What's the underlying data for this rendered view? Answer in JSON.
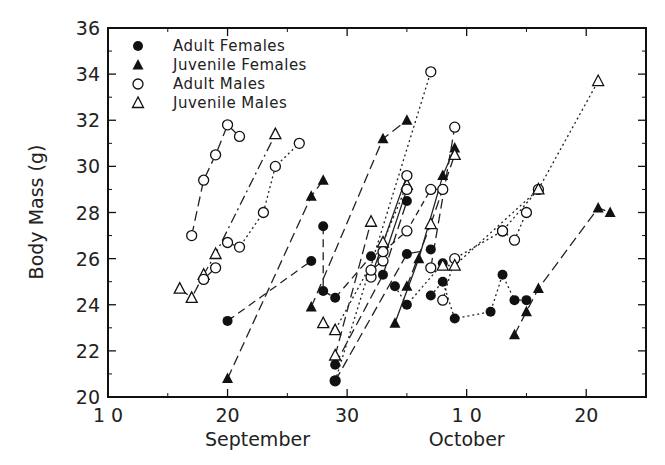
{
  "chart_data": {
    "type": "scatter",
    "title": "",
    "xlabel": "",
    "ylabel": "Body Mass (g)",
    "x_unit": "day (Sep 10 = 10; Oct 1 = 31)",
    "xlim": [
      10,
      55
    ],
    "ylim": [
      20,
      36
    ],
    "x_ticks": [
      {
        "value": 10,
        "label": "1 0"
      },
      {
        "value": 20,
        "label": "20"
      },
      {
        "value": 30,
        "label": "30"
      },
      {
        "value": 40,
        "label": "1 0"
      },
      {
        "value": 50,
        "label": "20"
      }
    ],
    "x_minor_ticks": [
      15,
      25,
      35,
      45
    ],
    "month_labels": [
      {
        "label": "September",
        "center": 22.5
      },
      {
        "label": "October",
        "center": 40
      }
    ],
    "y_ticks": [
      20,
      22,
      24,
      26,
      28,
      30,
      32,
      34,
      36
    ],
    "y_minor_ticks": [
      21,
      23,
      25,
      27,
      29,
      31,
      33,
      35
    ],
    "grid": false,
    "legend_position": "upper-left",
    "legend": [
      {
        "label": "Adult Females",
        "marker": "filled-circle"
      },
      {
        "label": "Juvenile Females",
        "marker": "filled-triangle"
      },
      {
        "label": "Adult Males",
        "marker": "open-circle"
      },
      {
        "label": "Juvenile Males",
        "marker": "open-triangle"
      }
    ],
    "series": [
      {
        "name": "Adult Males",
        "marker": "open-circle",
        "dash": "10,5",
        "points": [
          [
            17,
            27.0
          ],
          [
            18,
            29.4
          ],
          [
            19,
            30.5
          ],
          [
            20,
            31.8
          ],
          [
            21,
            31.3
          ]
        ]
      },
      {
        "name": "Adult Males",
        "marker": "open-circle",
        "dash": "2,3",
        "points": [
          [
            20,
            26.7
          ],
          [
            21,
            26.5
          ],
          [
            23,
            28.0
          ],
          [
            24,
            30.0
          ],
          [
            26,
            31.0
          ]
        ]
      },
      {
        "name": "Juvenile Males",
        "marker": "open-triangle",
        "dash": "10,4,2,4",
        "points": [
          [
            16,
            24.7
          ],
          [
            17,
            24.3
          ],
          [
            18,
            25.3
          ],
          [
            19,
            26.2
          ],
          [
            24,
            31.4
          ]
        ]
      },
      {
        "name": "Adult Males",
        "marker": "open-circle",
        "dash": "",
        "points": [
          [
            18,
            25.1
          ],
          [
            19,
            25.6
          ]
        ]
      },
      {
        "name": "Adult Females",
        "marker": "filled-circle",
        "dash": "8,5",
        "points": [
          [
            20,
            23.3
          ],
          [
            27,
            25.9
          ]
        ]
      },
      {
        "name": "Juvenile Females",
        "marker": "filled-triangle",
        "dash": "10,5",
        "points": [
          [
            20,
            20.8
          ],
          [
            27,
            28.7
          ],
          [
            28,
            29.4
          ]
        ]
      },
      {
        "name": "Adult Females",
        "marker": "filled-circle",
        "dash": "8,5",
        "points": [
          [
            28,
            27.4
          ],
          [
            28,
            24.6
          ],
          [
            29,
            24.3
          ],
          [
            32,
            26.1
          ]
        ]
      },
      {
        "name": "Juvenile Females",
        "marker": "filled-triangle",
        "dash": "10,5",
        "points": [
          [
            27,
            23.9
          ],
          [
            33,
            31.2
          ],
          [
            35,
            32.0
          ]
        ]
      },
      {
        "name": "Juvenile Males",
        "marker": "open-triangle",
        "dash": "2,3",
        "points": [
          [
            28,
            23.2
          ],
          [
            29,
            22.9
          ],
          [
            33,
            26.7
          ],
          [
            35,
            29.2
          ]
        ]
      },
      {
        "name": "Juvenile Males",
        "marker": "open-triangle",
        "dash": "10,5",
        "points": [
          [
            29,
            21.8
          ],
          [
            32,
            27.6
          ]
        ]
      },
      {
        "name": "Adult Females",
        "marker": "filled-circle",
        "dash": "10,5",
        "points": [
          [
            29,
            21.4
          ],
          [
            33,
            25.3
          ],
          [
            35,
            28.5
          ]
        ]
      },
      {
        "name": "Adult Males",
        "marker": "open-circle",
        "dash": "2,3",
        "points": [
          [
            29,
            20.7
          ],
          [
            37,
            34.1
          ]
        ]
      },
      {
        "name": "Adult Females",
        "marker": "filled-circle",
        "dash": "10,5",
        "points": [
          [
            29,
            20.7
          ],
          [
            35,
            26.2
          ],
          [
            37,
            26.4
          ]
        ]
      },
      {
        "name": "Adult Males",
        "marker": "open-circle",
        "dash": "",
        "points": [
          [
            32,
            25.2
          ],
          [
            35,
            29.6
          ]
        ]
      },
      {
        "name": "Adult Males",
        "marker": "open-circle",
        "dash": "",
        "points": [
          [
            32,
            25.5
          ],
          [
            33,
            25.9
          ],
          [
            35,
            29.0
          ]
        ]
      },
      {
        "name": "Adult Males",
        "marker": "open-circle",
        "dash": "6,4",
        "points": [
          [
            33,
            26.3
          ],
          [
            35,
            27.2
          ],
          [
            37,
            29.0
          ],
          [
            38,
            29.0
          ]
        ]
      },
      {
        "name": "Adult Females",
        "marker": "filled-circle",
        "dash": "2,3",
        "points": [
          [
            34,
            24.8
          ],
          [
            35,
            24.0
          ],
          [
            38,
            25.8
          ]
        ]
      },
      {
        "name": "Juvenile Females",
        "marker": "filled-triangle",
        "dash": "",
        "points": [
          [
            34,
            23.2
          ],
          [
            36,
            26.0
          ],
          [
            38,
            29.6
          ],
          [
            39,
            30.8
          ]
        ]
      },
      {
        "name": "Juvenile Females",
        "marker": "filled-triangle",
        "dash": "10,5",
        "points": [
          [
            35,
            24.8
          ],
          [
            37,
            27.5
          ]
        ]
      },
      {
        "name": "Juvenile Males",
        "marker": "open-triangle",
        "dash": "10,5",
        "points": [
          [
            37,
            27.5
          ],
          [
            39,
            30.5
          ]
        ]
      },
      {
        "name": "Adult Males",
        "marker": "open-circle",
        "dash": "10,5",
        "points": [
          [
            37,
            25.6
          ],
          [
            39,
            31.7
          ]
        ]
      },
      {
        "name": "Adult Females",
        "marker": "filled-circle",
        "dash": "2,3",
        "points": [
          [
            37,
            24.4
          ],
          [
            38,
            25.0
          ],
          [
            39,
            23.4
          ],
          [
            42,
            23.7
          ],
          [
            43,
            25.3
          ],
          [
            44,
            24.2
          ],
          [
            45,
            24.2
          ]
        ]
      },
      {
        "name": "Adult Males",
        "marker": "open-circle",
        "dash": "2,3",
        "points": [
          [
            38,
            24.2
          ],
          [
            39,
            26.0
          ],
          [
            43,
            27.2
          ],
          [
            46,
            29.0
          ]
        ]
      },
      {
        "name": "Juvenile Males",
        "marker": "open-triangle",
        "dash": "2,3",
        "points": [
          [
            38,
            25.7
          ],
          [
            39,
            25.7
          ],
          [
            46,
            29.0
          ],
          [
            51,
            33.7
          ]
        ]
      },
      {
        "name": "Adult Males",
        "marker": "open-circle",
        "dash": "2,3",
        "points": [
          [
            43,
            27.2
          ],
          [
            44,
            26.8
          ],
          [
            45,
            28.0
          ]
        ]
      },
      {
        "name": "Juvenile Females",
        "marker": "filled-triangle",
        "dash": "10,5",
        "points": [
          [
            44,
            22.7
          ],
          [
            45,
            23.7
          ],
          [
            46,
            24.7
          ],
          [
            51,
            28.2
          ],
          [
            52,
            28.0
          ]
        ]
      }
    ]
  }
}
